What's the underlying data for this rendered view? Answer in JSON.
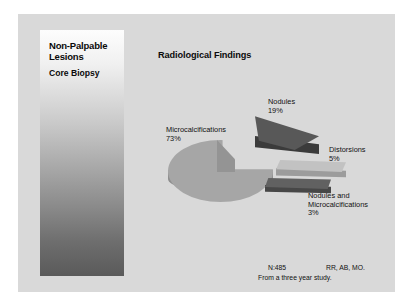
{
  "slide": {
    "panel": {
      "heading": "Non-Palpable Lesions",
      "subheading": "Core Biopsy"
    },
    "footer": {
      "sample_size": "N:485",
      "authors": "RR, AB, MO.",
      "study_note": "From a three year study."
    }
  },
  "chart_data": {
    "type": "pie",
    "title": "Radiological Findings",
    "xlabel": "",
    "ylabel": "",
    "exploded": true,
    "three_d": true,
    "legend_position": "callout-labels",
    "categories": [
      "Microcalcifications",
      "Nodules",
      "Distorsions",
      "Nodules and Microcalcifications"
    ],
    "values": [
      73,
      19,
      5,
      3
    ],
    "value_labels": [
      "73%",
      "19%",
      "5%",
      "3%"
    ],
    "colors": [
      "#a6a6a6",
      "#585858",
      "#c2c2c2",
      "#616161"
    ],
    "labels": [
      {
        "name": "Microcalcifications",
        "pct": "73%"
      },
      {
        "name": "Nodules",
        "pct": "19%"
      },
      {
        "name": "Distorsions",
        "pct": "5%"
      },
      {
        "name": "Nodules and Microcalcifications",
        "pct": "3%",
        "line1": "Nodules and",
        "line2": "Microcalcifications"
      }
    ],
    "total": "N:485"
  }
}
